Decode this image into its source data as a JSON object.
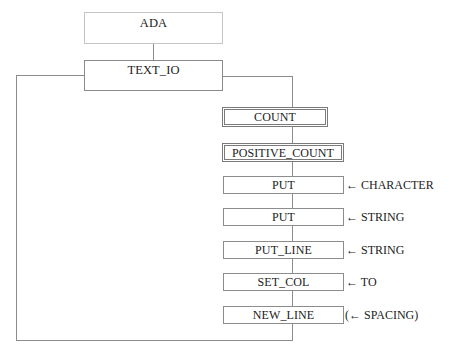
{
  "diagram": {
    "root": {
      "label": "ADA"
    },
    "package": {
      "label": "TEXT_IO"
    },
    "members": [
      {
        "label": "COUNT",
        "kind": "type",
        "param": ""
      },
      {
        "label": "POSITIVE_COUNT",
        "kind": "type",
        "param": ""
      },
      {
        "label": "PUT",
        "kind": "procedure",
        "param": "← CHARACTER"
      },
      {
        "label": "PUT",
        "kind": "procedure",
        "param": "← STRING"
      },
      {
        "label": "PUT_LINE",
        "kind": "procedure",
        "param": "← STRING"
      },
      {
        "label": "SET_COL",
        "kind": "procedure",
        "param": "← TO"
      },
      {
        "label": "NEW_LINE",
        "kind": "procedure",
        "param": "(← SPACING)"
      }
    ],
    "colors": {
      "line": "#8c8c8c",
      "root_border": "#c4c4c4",
      "box_border": "#8a8a8a",
      "text": "#222222"
    }
  }
}
